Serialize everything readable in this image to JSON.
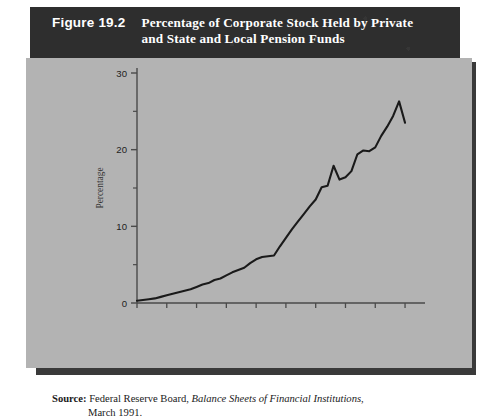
{
  "figure": {
    "number": "Figure 19.2",
    "title_line1": "Percentage of Corporate Stock Held by Private",
    "title_line2": "and State and Local Pension Funds"
  },
  "source": {
    "label": "Source:",
    "publisher": "Federal Reserve Board,",
    "work": "Balance Sheets of Financial Institutions",
    "tail": ",",
    "date": "March 1991."
  },
  "colors": {
    "banner_background": "#2e2e2e",
    "banner_text": "#ffffff",
    "panel_background": "#b3b3b3",
    "shadow": "#3a3a3a",
    "line": "#1a1a1a",
    "axis": "#4a4a4a",
    "page_background": "#ffffff"
  },
  "chart_data": {
    "type": "line",
    "title": "Percentage of Corporate Stock Held by Private and State and Local Pension Funds",
    "xlabel": "",
    "ylabel": "Percentage",
    "xlim": [
      1945,
      1991
    ],
    "ylim": [
      0,
      30
    ],
    "grid": false,
    "legend": false,
    "x_ticks": [
      1945,
      1950,
      1955,
      1960,
      1965,
      1970,
      1975,
      1980,
      1985,
      1990
    ],
    "x_tick_labels": [
      "1945",
      "1950",
      "1955",
      "1960",
      "1965",
      "1970",
      "1975",
      "1980",
      "1985",
      "1990"
    ],
    "y_ticks": [
      0,
      10,
      20,
      30
    ],
    "y_tick_labels": [
      "0",
      "10",
      "20",
      "30"
    ],
    "y_minor_ticks": [
      5,
      15,
      25
    ],
    "series": [
      {
        "name": "Percentage of corporate stock held by pension funds",
        "x": [
          1945,
          1946,
          1947,
          1948,
          1949,
          1950,
          1951,
          1952,
          1953,
          1954,
          1955,
          1956,
          1957,
          1958,
          1959,
          1960,
          1961,
          1962,
          1963,
          1964,
          1965,
          1966,
          1967,
          1968,
          1969,
          1970,
          1971,
          1972,
          1973,
          1974,
          1975,
          1976,
          1977,
          1978,
          1979,
          1980,
          1981,
          1982,
          1983,
          1984,
          1985,
          1986,
          1987,
          1988,
          1989,
          1990
        ],
        "values": [
          0.3,
          0.4,
          0.5,
          0.6,
          0.8,
          1.0,
          1.2,
          1.4,
          1.6,
          1.8,
          2.1,
          2.4,
          2.6,
          3.0,
          3.2,
          3.6,
          4.0,
          4.3,
          4.6,
          5.2,
          5.7,
          6.0,
          6.1,
          6.2,
          7.4,
          8.5,
          9.6,
          10.6,
          11.6,
          12.6,
          13.5,
          15.1,
          15.3,
          17.9,
          16.1,
          16.4,
          17.2,
          19.4,
          19.9,
          19.8,
          20.3,
          21.8,
          23.0,
          24.4,
          26.3,
          23.5
        ]
      }
    ]
  },
  "axis": {
    "y_axis_title": "Percentage"
  }
}
